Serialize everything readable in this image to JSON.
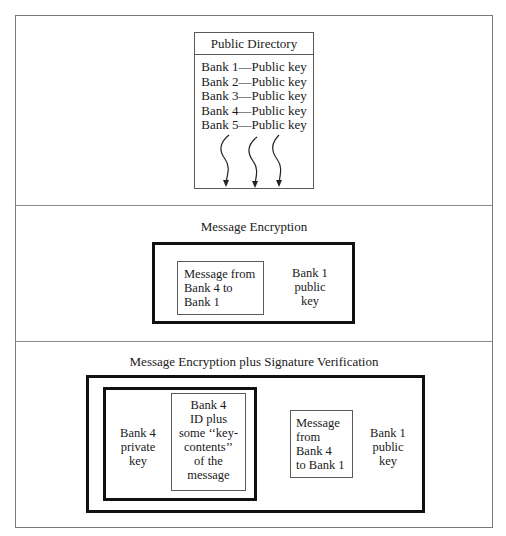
{
  "directory": {
    "title": "Public Directory",
    "entries": [
      "Bank 1—Public key",
      "Bank 2—Public key",
      "Bank 3—Public key",
      "Bank 4—Public key",
      "Bank 5—Public key"
    ],
    "arrow_count": 3
  },
  "encryption": {
    "title": "Message Encryption",
    "message_box": [
      "Message from",
      "Bank 4 to",
      "Bank 1"
    ],
    "key_label": [
      "Bank 1",
      "public",
      "key"
    ]
  },
  "signature": {
    "title": "Message Encryption plus Signature Verification",
    "private_key_label": [
      "Bank 4",
      "private",
      "key"
    ],
    "signature_box": [
      "Bank 4",
      "ID plus",
      "some ‘‘key-",
      "contents’’",
      "of the",
      "message"
    ],
    "message_box": [
      "Message",
      "from",
      "Bank 4",
      "to Bank 1"
    ],
    "public_key_label": [
      "Bank 1",
      "public",
      "key"
    ]
  }
}
